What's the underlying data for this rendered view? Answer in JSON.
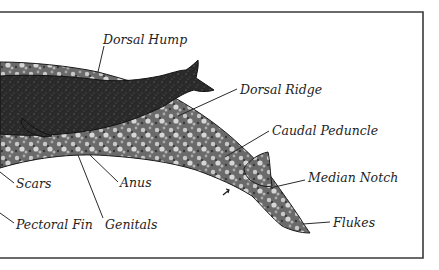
{
  "figure": {
    "colors": {
      "background": "#ffffff",
      "ink": "#1e1e1e",
      "whale_dark": "#2b2b2b",
      "whale_mottle": "#8a8a8a",
      "whale_light": "#cfcfcf"
    },
    "labels": [
      {
        "id": "dorsal-hump",
        "text": "Dorsal Hump"
      },
      {
        "id": "dorsal-ridge",
        "text": "Dorsal Ridge"
      },
      {
        "id": "caudal-peduncle",
        "text": "Caudal Peduncle"
      },
      {
        "id": "median-notch",
        "text": "Median Notch"
      },
      {
        "id": "flukes",
        "text": "Flukes"
      },
      {
        "id": "scars",
        "text": "Scars"
      },
      {
        "id": "anus",
        "text": "Anus"
      },
      {
        "id": "pectoral-fin",
        "text": "Pectoral Fin"
      },
      {
        "id": "genitals",
        "text": "Genitals"
      }
    ]
  }
}
